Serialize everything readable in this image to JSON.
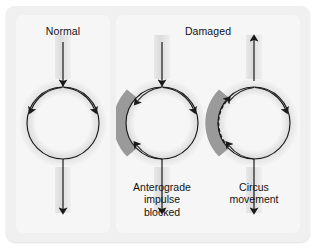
{
  "figure": {
    "background_color": "#f0f0f0",
    "panel_color": "#f6f6f6",
    "vessel_color": "#e2e2e2",
    "damaged_color": "#9a9a9a",
    "stroke_color": "#1a1a1a"
  },
  "panels": [
    {
      "id": "normal",
      "title": "Normal",
      "caption": "",
      "description": "Impulse enters from above, divides at the top of the loop and travels down both limbs, recombining and exiting below.",
      "top_arrow_direction": "down",
      "bottom_arrow_direction": "down",
      "has_damaged_segment": false,
      "has_dashed_path": false
    },
    {
      "id": "anterograde-blocked",
      "title": "",
      "caption_lines": [
        "Anterograde",
        "impulse",
        "blocked"
      ],
      "caption": "Anterograde impulse blocked",
      "description": "A damaged segment on the left limb blocks forward conduction; the impulse travels down the right limb and re-enters the damaged zone from below.",
      "top_arrow_direction": "down",
      "bottom_arrow_direction": "down",
      "has_damaged_segment": true,
      "has_dashed_path": false
    },
    {
      "id": "circus-movement",
      "title": "",
      "caption_lines": [
        "Circus",
        "movement"
      ],
      "caption": "Circus movement",
      "description": "The impulse passes slowly retrograde through the damaged segment (dashed) and re-excites the tissue, producing a self-sustaining circus movement; output travels both up and down.",
      "top_arrow_direction": "up",
      "bottom_arrow_direction": "down",
      "has_damaged_segment": true,
      "has_dashed_path": true
    }
  ],
  "group_titles": {
    "normal": "Normal",
    "damaged": "Damaged"
  }
}
